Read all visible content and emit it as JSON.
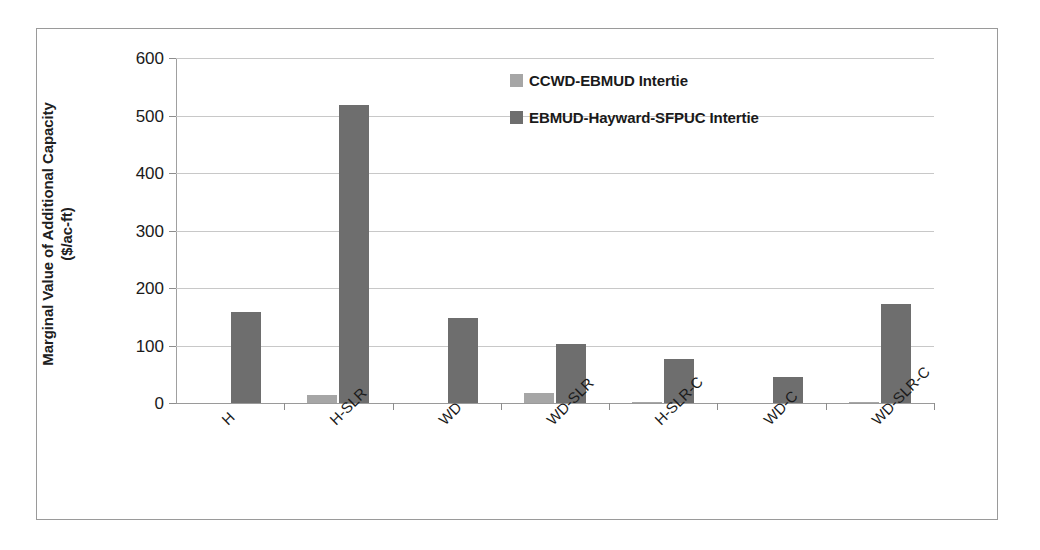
{
  "chart_data": {
    "type": "bar",
    "title": "",
    "subtitle": "",
    "xlabel": "",
    "ylabel": "Marginal Value of Additional Capacity\n($/ac-ft)",
    "categories": [
      "H",
      "H-SLR",
      "WD",
      "WD-SLR",
      "H-SLR-C",
      "WD-C",
      "WD-SLR-C"
    ],
    "series": [
      {
        "name": "CCWD-EBMUD Intertie",
        "color": "#a6a6a6",
        "values": [
          0,
          14,
          0,
          18,
          2,
          0,
          2
        ]
      },
      {
        "name": "EBMUD-Hayward-SFPUC Intertie",
        "color": "#6e6e6e",
        "values": [
          159,
          518,
          148,
          102,
          76,
          46,
          173
        ]
      }
    ],
    "ylim": [
      0,
      600
    ],
    "yticks": [
      0,
      100,
      200,
      300,
      400,
      500,
      600
    ],
    "ytick_labels": [
      "0",
      "100",
      "200",
      "300",
      "400",
      "500",
      "600"
    ],
    "grid": true,
    "legend_position": "upper-center"
  },
  "axes": {
    "y_title": "Marginal Value of Additional Capacity\n($/ac-ft)"
  },
  "legend": {
    "entries": [
      {
        "label": "CCWD-EBMUD Intertie",
        "color": "#a6a6a6"
      },
      {
        "label": "EBMUD-Hayward-SFPUC Intertie",
        "color": "#6e6e6e"
      }
    ]
  }
}
